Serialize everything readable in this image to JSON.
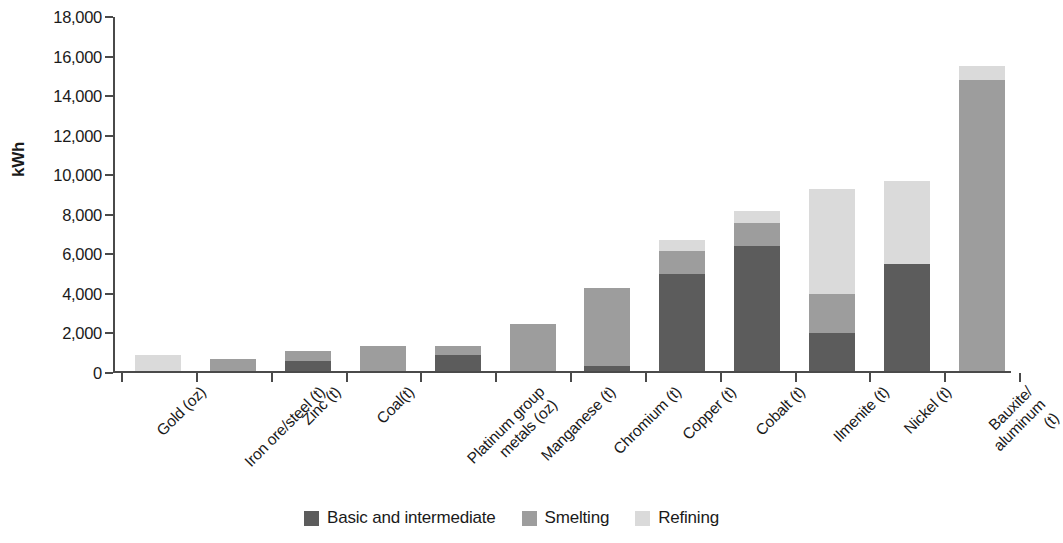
{
  "chart_data": {
    "type": "bar",
    "subtype": "stacked-bar",
    "title": "",
    "xlabel": "",
    "ylabel": "kWh",
    "ylim": [
      0,
      18000
    ],
    "ytick_values": [
      0,
      2000,
      4000,
      6000,
      8000,
      10000,
      12000,
      14000,
      16000,
      18000
    ],
    "ytick_labels": [
      "0",
      "2,000",
      "4,000",
      "6,000",
      "8,000",
      "10,000",
      "12,000",
      "14,000",
      "16,000",
      "18,000"
    ],
    "grid": false,
    "legend_position": "bottom-center",
    "categories": [
      "Gold (oz)",
      "Iron ore/steel (t)",
      "Zinc (t)",
      "Coal(t)",
      "Platinum group\nmetals (oz)",
      "Manganese (t)",
      "Chromium (t)",
      "Copper (t)",
      "Cobalt (t)",
      "Ilmenite (t)",
      "Nickel (t)",
      "Bauxite/\naluminum (t)"
    ],
    "series": [
      {
        "name": "Basic and intermediate",
        "color": "#5c5c5c",
        "values": [
          0,
          0,
          500,
          0,
          800,
          0,
          250,
          4900,
          6300,
          1900,
          5400,
          0
        ]
      },
      {
        "name": "Smelting",
        "color": "#9d9d9d",
        "values": [
          0,
          600,
          500,
          1250,
          450,
          2400,
          3950,
          1150,
          1200,
          2000,
          0,
          14700
        ]
      },
      {
        "name": "Refining",
        "color": "#dadada",
        "values": [
          800,
          0,
          0,
          0,
          0,
          0,
          0,
          550,
          600,
          5300,
          4200,
          700
        ]
      }
    ],
    "totals": [
      800,
      600,
      1000,
      1250,
      1250,
      2400,
      4200,
      6600,
      8100,
      9200,
      9600,
      15400
    ]
  },
  "legend": {
    "items": [
      {
        "label": "Basic and intermediate",
        "color": "#5c5c5c",
        "swatch": "legend-swatch-basic"
      },
      {
        "label": "Smelting",
        "color": "#9d9d9d",
        "swatch": "legend-swatch-smelting"
      },
      {
        "label": "Refining",
        "color": "#dadada",
        "swatch": "legend-swatch-refining"
      }
    ]
  },
  "axis": {
    "y_title": "kWh"
  }
}
